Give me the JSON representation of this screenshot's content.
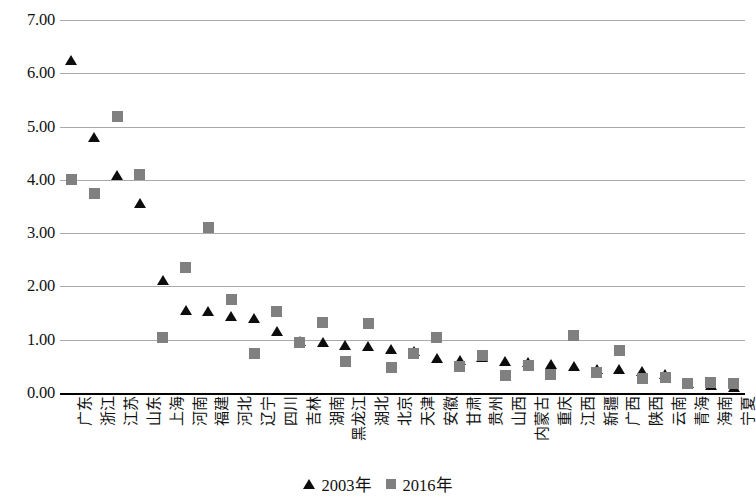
{
  "chart_data": {
    "type": "scatter",
    "title": "",
    "xlabel": "",
    "ylabel": "",
    "ylim": [
      0,
      7
    ],
    "ytick_step": 1,
    "grid": true,
    "legend_position": "bottom",
    "categories": [
      "广东",
      "浙江",
      "江苏",
      "山东",
      "上海",
      "河南",
      "福建",
      "河北",
      "辽宁",
      "四川",
      "吉林",
      "湖南",
      "黑龙江",
      "湖北",
      "北京",
      "天津",
      "安徽",
      "甘肃",
      "贵州",
      "山西",
      "内蒙古",
      "重庆",
      "江西",
      "新疆",
      "广西",
      "陕西",
      "云南",
      "青海",
      "海南",
      "宁夏"
    ],
    "series": [
      {
        "name": "2003年",
        "marker": "triangle",
        "color": "#0d0d0d",
        "values": [
          6.25,
          4.8,
          4.1,
          3.57,
          2.12,
          1.55,
          1.53,
          1.45,
          1.4,
          1.17,
          0.97,
          0.95,
          0.9,
          0.88,
          0.82,
          0.78,
          0.65,
          0.62,
          0.68,
          0.6,
          0.58,
          0.55,
          0.5,
          0.45,
          0.45,
          0.42,
          0.35,
          0.18,
          0.15,
          0.12
        ]
      },
      {
        "name": "2016年",
        "marker": "square",
        "color": "#808080",
        "values": [
          4.0,
          3.75,
          5.18,
          4.1,
          1.05,
          2.35,
          3.1,
          1.75,
          0.75,
          1.53,
          0.95,
          1.33,
          0.6,
          1.3,
          0.48,
          0.75,
          1.05,
          0.5,
          0.7,
          0.33,
          0.52,
          0.35,
          1.08,
          0.38,
          0.8,
          0.28,
          0.3,
          0.18,
          0.2,
          0.18
        ]
      }
    ],
    "ytick_labels": [
      "7.00",
      "6.00",
      "5.00",
      "4.00",
      "3.00",
      "2.00",
      "1.00",
      "0.00"
    ],
    "ytick_values": [
      7,
      6,
      5,
      4,
      3,
      2,
      1,
      0
    ]
  },
  "legend": {
    "entries": [
      {
        "label": "2003年",
        "marker": "triangle"
      },
      {
        "label": "2016年",
        "marker": "square"
      }
    ]
  }
}
